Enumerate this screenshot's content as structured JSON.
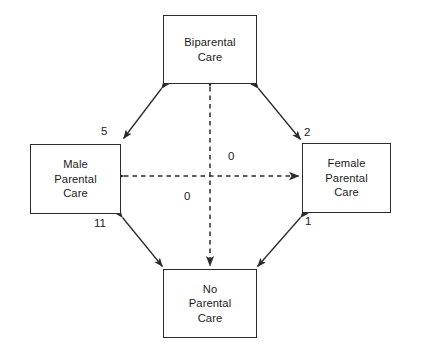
{
  "figure": {
    "type": "state-transition-diagram",
    "background_color": "#ffffff",
    "line_color": "#2b2b2b",
    "text_color": "#1b1b1b"
  },
  "nodes": {
    "biparental": {
      "id": "biparental-care",
      "lines": [
        "Biparental",
        "Care"
      ]
    },
    "male": {
      "id": "male-parental-care",
      "lines": [
        "Male",
        "Parental",
        "Care"
      ]
    },
    "female": {
      "id": "female-parental-care",
      "lines": [
        "Female",
        "Parental",
        "Care"
      ]
    },
    "none": {
      "id": "no-parental-care",
      "lines": [
        "No",
        "Parental",
        "Care"
      ]
    }
  },
  "edges": [
    {
      "id": "biparental-male",
      "from": "biparental",
      "to": "male",
      "label": "5",
      "style": "solid",
      "arrows": "double"
    },
    {
      "id": "biparental-female",
      "from": "biparental",
      "to": "female",
      "label": "2",
      "style": "solid",
      "arrows": "double"
    },
    {
      "id": "male-none",
      "from": "male",
      "to": "none",
      "label": "11",
      "style": "solid",
      "arrows": "double"
    },
    {
      "id": "female-none",
      "from": "female",
      "to": "none",
      "label": "1",
      "style": "solid",
      "arrows": "double"
    },
    {
      "id": "biparental-none",
      "from": "biparental",
      "to": "none",
      "label": "0",
      "style": "dashed",
      "arrows": "double"
    },
    {
      "id": "male-female",
      "from": "male",
      "to": "female",
      "label": "0",
      "style": "dashed",
      "arrows": "double"
    }
  ],
  "edge_labels": {
    "biparental_male": "5",
    "biparental_female": "2",
    "male_none": "11",
    "female_none": "1",
    "vertical_dashed": "0",
    "horizontal_dashed": "0"
  },
  "caption": {
    "partial_text": ""
  }
}
